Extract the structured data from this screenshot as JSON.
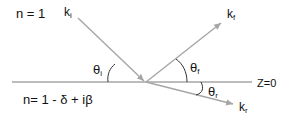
{
  "diagram": {
    "medium_top_label": "n = 1",
    "medium_bottom_label": "n= 1 - δ + iβ",
    "interface_label": "Z=0",
    "vectors": {
      "incident": {
        "base": "k",
        "sub": "i"
      },
      "reflected": {
        "base": "k",
        "sub": "f"
      },
      "refracted": {
        "base": "k",
        "sub": "r"
      }
    },
    "angles": {
      "incident": {
        "base": "θ",
        "sub": "i"
      },
      "reflected": {
        "base": "θ",
        "sub": "f"
      },
      "refracted": {
        "base": "θ",
        "sub": "r"
      }
    },
    "colors": {
      "line": "#a6a6a6",
      "text": "#111111",
      "arc": "#333333"
    }
  }
}
